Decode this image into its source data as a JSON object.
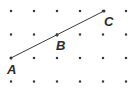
{
  "figure": {
    "type": "geometry-dot-grid",
    "width": 140,
    "height": 90,
    "background_color": "#ffffff"
  },
  "grid": {
    "name": "dot-grid",
    "columns": 6,
    "rows": 4,
    "x_spacing": 23,
    "y_spacing": 23.5,
    "origin_x": 11,
    "origin_y": 11,
    "dot_size": 2.2,
    "dot_color": "#3a3a3a",
    "x_positions": [
      11,
      34,
      57,
      80,
      103,
      126
    ],
    "y_positions": [
      11,
      34.5,
      58,
      81.5
    ]
  },
  "segment": {
    "name": "segment-AC",
    "color": "#3a3a3a",
    "stroke_width": 1,
    "from": {
      "x": 11,
      "y": 58
    },
    "to": {
      "x": 104,
      "y": 11
    }
  },
  "points": [
    {
      "id": "A",
      "label": "A",
      "x": 11,
      "y": 58,
      "label_x": 7,
      "label_y": 63,
      "on_grid": true
    },
    {
      "id": "B",
      "label": "B",
      "x": 57,
      "y": 35,
      "label_x": 56,
      "label_y": 39,
      "on_grid": true
    },
    {
      "id": "C",
      "label": "C",
      "x": 104,
      "y": 11,
      "label_x": 104,
      "label_y": 15,
      "on_grid": true
    }
  ]
}
